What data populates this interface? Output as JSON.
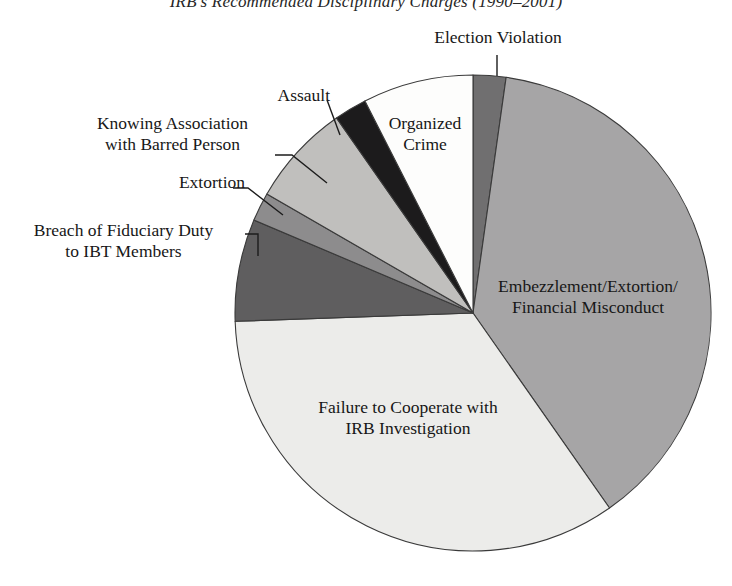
{
  "chart_data": {
    "type": "pie",
    "title": "IRB's Recommended Disciplinary Charges (1990–2001)",
    "xlabel": "",
    "ylabel": "",
    "legend_position": "none",
    "grid": false,
    "labels_placement": "callout-and-inside",
    "categories": [
      "Election Violation",
      "Embezzlement/Extortion/Financial Misconduct",
      "Failure to Cooperate with IRB Investigation",
      "Breach of Fiduciary Duty to IBT Members",
      "Extortion",
      "Knowing Association with Barred Person",
      "Assault",
      "Organized Crime"
    ],
    "values": [
      2.2,
      38.1,
      34.2,
      6.9,
      1.9,
      7.0,
      2.2,
      7.5
    ],
    "slices": [
      {
        "label": "Election Violation",
        "value": 2.2,
        "start_angle": 0,
        "end_angle": 8,
        "color": "#706f70",
        "label_lines": [
          "Election Violation"
        ],
        "label_mode": "callout"
      },
      {
        "label": "Embezzlement/Extortion/Financial Misconduct",
        "value": 38.1,
        "start_angle": 8,
        "end_angle": 145,
        "color": "#a6a5a6",
        "label_lines": [
          "Embezzlement/Extortion/",
          "Financial Misconduct"
        ],
        "label_mode": "inside"
      },
      {
        "label": "Failure to Cooperate with IRB Investigation",
        "value": 34.2,
        "start_angle": 145,
        "end_angle": 268,
        "color": "#ececea",
        "label_lines": [
          "Failure to Cooperate with",
          "IRB Investigation"
        ],
        "label_mode": "inside"
      },
      {
        "label": "Breach of Fiduciary Duty to IBT Members",
        "value": 6.9,
        "start_angle": 268,
        "end_angle": 293,
        "color": "#5f5e5f",
        "label_lines": [
          "Breach of Fiduciary Duty",
          "to IBT Members"
        ],
        "label_mode": "callout"
      },
      {
        "label": "Extortion",
        "value": 1.9,
        "start_angle": 293,
        "end_angle": 300,
        "color": "#8d8c8d",
        "label_lines": [
          "Extortion"
        ],
        "label_mode": "callout"
      },
      {
        "label": "Knowing Association with Barred Person",
        "value": 7.0,
        "start_angle": 300,
        "end_angle": 325,
        "color": "#c0bfbd",
        "label_lines": [
          "Knowing Association",
          "with Barred Person"
        ],
        "label_mode": "callout"
      },
      {
        "label": "Assault",
        "value": 2.2,
        "start_angle": 325,
        "end_angle": 333,
        "color": "#1c1b1c",
        "label_lines": [
          "Assault"
        ],
        "label_mode": "callout"
      },
      {
        "label": "Organized Crime",
        "value": 7.5,
        "start_angle": 333,
        "end_angle": 360,
        "color": "#fdfdfc",
        "label_lines": [
          "Organized Crime"
        ],
        "label_mode": "inside"
      }
    ],
    "geometry": {
      "center_x": 473,
      "center_y": 313,
      "radius": 238,
      "stroke_color": "#3a3a3a",
      "stroke_width": 1.1
    }
  },
  "labels": {
    "election_violation": "Election Violation",
    "assault": "Assault",
    "knowing_association_1": "Knowing Association",
    "knowing_association_2": "with Barred Person",
    "extortion": "Extortion",
    "breach_fiduciary_1": "Breach of Fiduciary Duty",
    "breach_fiduciary_2": "to IBT Members",
    "organized_crime_1": "Organized",
    "organized_crime_2": "Crime",
    "embezzlement_1": "Embezzlement/Extortion/",
    "embezzlement_2": "Financial Misconduct",
    "failure_cooperate_1": "Failure to Cooperate with",
    "failure_cooperate_2": "IRB Investigation"
  },
  "title": "IRB's Recommended Disciplinary Charges (1990–2001)"
}
